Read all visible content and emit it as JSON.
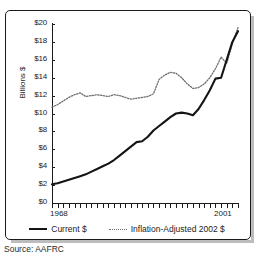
{
  "source_note": "Source: AAFRC",
  "legend": {
    "position": "bottom",
    "items": [
      {
        "label": "Current $",
        "style": "solid",
        "color": "#141414",
        "icon": "solid-line-swatch"
      },
      {
        "label": "Inflation-Adjusted 2002 $",
        "style": "dotted",
        "color": "#6e6e6e",
        "icon": "dotted-line-swatch"
      }
    ]
  },
  "chart_data": {
    "type": "line",
    "title": "",
    "subtitle": "",
    "xlabel": "",
    "ylabel": "Billions $",
    "xlim": [
      1968,
      2001
    ],
    "ylim": [
      0,
      20
    ],
    "grid": false,
    "legend_position": "bottom",
    "x_tick_labels": [
      "1968",
      "2001"
    ],
    "y_tick_labels": [
      "$0",
      "$2",
      "$4",
      "$6",
      "$8",
      "$10",
      "$12",
      "$14",
      "$16",
      "$18",
      "$20"
    ],
    "y_tick_values": [
      0,
      2,
      4,
      6,
      8,
      10,
      12,
      14,
      16,
      18,
      20
    ],
    "y_tick_step": 2,
    "x_tick_count": 34,
    "x": [
      1968,
      1969,
      1970,
      1971,
      1972,
      1973,
      1974,
      1975,
      1976,
      1977,
      1978,
      1979,
      1980,
      1981,
      1982,
      1983,
      1984,
      1985,
      1986,
      1987,
      1988,
      1989,
      1990,
      1991,
      1992,
      1993,
      1994,
      1995,
      1996,
      1997,
      1998,
      1999,
      2000,
      2001
    ],
    "series": [
      {
        "name": "Current $",
        "style": "solid",
        "color": "#141414",
        "values": [
          2.1,
          2.2,
          2.4,
          2.6,
          2.8,
          3.0,
          3.2,
          3.5,
          3.8,
          4.1,
          4.4,
          4.8,
          5.3,
          5.8,
          6.3,
          6.8,
          6.9,
          7.4,
          8.1,
          8.6,
          9.1,
          9.6,
          10.0,
          10.1,
          10.0,
          9.8,
          10.5,
          11.5,
          12.6,
          13.9,
          14.0,
          16.0,
          18.0,
          19.2
        ]
      },
      {
        "name": "Inflation-Adjusted 2002 $",
        "style": "dotted",
        "color": "#6e6e6e",
        "values": [
          10.7,
          11.0,
          11.4,
          11.8,
          12.1,
          12.3,
          11.9,
          12.0,
          12.1,
          12.0,
          11.9,
          12.1,
          12.0,
          11.8,
          11.6,
          11.7,
          11.8,
          11.9,
          12.2,
          13.8,
          14.3,
          14.6,
          14.5,
          14.0,
          13.3,
          12.8,
          12.9,
          13.3,
          14.0,
          15.0,
          16.3,
          15.6,
          17.8,
          19.6
        ]
      }
    ]
  }
}
